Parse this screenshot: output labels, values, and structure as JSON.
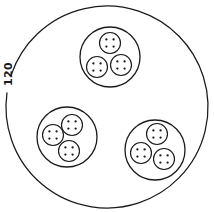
{
  "figure": {
    "background_color": "#ffffff",
    "stroke_color": "#1a1a1a",
    "canvas": {
      "width": 214,
      "height": 212
    },
    "callout": {
      "label": "120",
      "rotation_deg": -90,
      "x": 12,
      "y": 74
    },
    "outer_circle": {
      "name": "outer-boundary-circle",
      "cx": 107,
      "cy": 107,
      "r": 101,
      "gap_start_deg": 188,
      "gap_end_deg": 199
    },
    "clusters": [
      {
        "name": "cluster-top",
        "cx": 110,
        "cy": 57,
        "r": 30,
        "units": [
          {
            "name": "unit-top",
            "cx": 110,
            "cy": 43,
            "r": 10.5,
            "dots": 4
          },
          {
            "name": "unit-left",
            "cx": 97,
            "cy": 67,
            "r": 10.5,
            "dots": 4
          },
          {
            "name": "unit-right",
            "cx": 121,
            "cy": 65,
            "r": 10.5,
            "dots": 4
          }
        ]
      },
      {
        "name": "cluster-lower-left",
        "cx": 67,
        "cy": 137,
        "r": 30,
        "units": [
          {
            "name": "unit-top",
            "cx": 72,
            "cy": 125,
            "r": 10.5,
            "dots": 4
          },
          {
            "name": "unit-left",
            "cx": 53,
            "cy": 135,
            "r": 10.5,
            "dots": 4
          },
          {
            "name": "unit-bottom",
            "cx": 69,
            "cy": 151,
            "r": 10.5,
            "dots": 4
          }
        ]
      },
      {
        "name": "cluster-lower-right",
        "cx": 155,
        "cy": 150,
        "r": 30,
        "units": [
          {
            "name": "unit-top",
            "cx": 157,
            "cy": 134,
            "r": 10.5,
            "dots": 4
          },
          {
            "name": "unit-left",
            "cx": 141,
            "cy": 153,
            "r": 10.5,
            "dots": 4
          },
          {
            "name": "unit-right",
            "cx": 164,
            "cy": 159,
            "r": 10.5,
            "dots": 4
          }
        ]
      }
    ],
    "dot_pattern": {
      "name": "four-dot-square",
      "count": 4,
      "radius": 1.15,
      "offset": 3.6
    }
  }
}
